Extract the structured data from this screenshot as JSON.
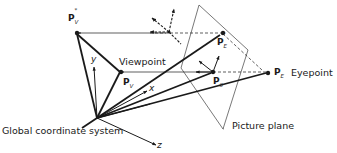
{
  "diagram": {
    "labels": {
      "viewpoint": "Viewpoint",
      "eyepoint": "Eyepoint",
      "global_coordinate_system": "Global coordinate system",
      "picture_plane": "Picture plane"
    },
    "points": {
      "pv_star": {
        "main": "P",
        "sub": "V",
        "sup": "*"
      },
      "pv": {
        "main": "P",
        "sub": "V"
      },
      "pe": {
        "main": "P",
        "sub": "E"
      },
      "pe_star": {
        "main": "P",
        "sub": "E",
        "sup": "*"
      },
      "p0": {
        "main": "P",
        "sub": "0"
      }
    },
    "axes": {
      "x": "x",
      "y": "y",
      "z": "z"
    },
    "colors": {
      "stroke": "#1a1a1a",
      "plane": "#555555",
      "background": "#ffffff"
    }
  }
}
